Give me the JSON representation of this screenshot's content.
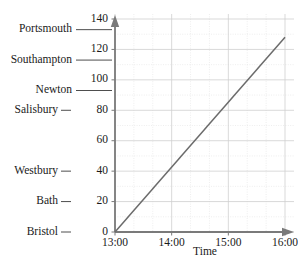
{
  "chart_data": {
    "type": "line",
    "title": "",
    "xlabel": "Time",
    "ylabel": "",
    "x": [
      "13:00",
      "16:00"
    ],
    "values": [
      0,
      128
    ],
    "series": [
      {
        "name": "journey",
        "points": [
          {
            "x": "13:00",
            "y": 0
          },
          {
            "x": "16:00",
            "y": 128
          }
        ]
      }
    ],
    "xlim": [
      "13:00",
      "16:00"
    ],
    "ylim": [
      0,
      140
    ],
    "grid": true,
    "legend": "none",
    "x_ticks": [
      "13:00",
      "14:00",
      "15:00",
      "16:00"
    ],
    "x_minor_per_major": 3,
    "y_ticks": [
      0,
      20,
      40,
      60,
      80,
      100,
      120,
      140
    ],
    "y_minor_per_major": 2,
    "stations": [
      {
        "label": "Portsmouth",
        "value": 133
      },
      {
        "label": "Southampton",
        "value": 113
      },
      {
        "label": "Newton",
        "value": 93
      },
      {
        "label": "Salisbury",
        "value": 80
      },
      {
        "label": "Westbury",
        "value": 40
      },
      {
        "label": "Bath",
        "value": 20
      },
      {
        "label": "Bristol",
        "value": 0
      }
    ],
    "colors": {
      "line": "#6b6b6b",
      "axis": "#7a7a7a",
      "grid_major": "#cfcfcf",
      "grid_minor": "#e2e2e2",
      "text": "#1a1a1a",
      "background": "#ffffff"
    }
  }
}
